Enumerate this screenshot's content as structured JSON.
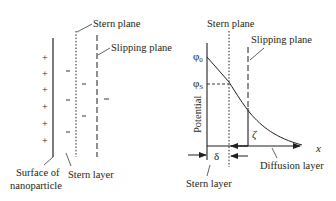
{
  "left_diagram": {
    "labels": {
      "stern_plane": "Stern plane",
      "slipping_plane": "Slipping plane",
      "surface_line1": "Surface of",
      "surface_line2": "nanoparticle",
      "stern_layer": "Stern layer"
    },
    "plus_sign": "+",
    "minus_sign": "−"
  },
  "right_diagram": {
    "labels": {
      "stern_plane": "Stern plane",
      "slipping_plane": "Slipping plane",
      "y_axis": "Potential",
      "x_axis": "x",
      "phi0": "φ",
      "phi0_sub": "0",
      "phis": "φ",
      "phis_sub": "S",
      "zeta": "ζ",
      "delta": "δ",
      "stern_layer": "Stern layer",
      "diffusion_layer": "Diffusion layer"
    }
  },
  "colors": {
    "ink": "#231f20",
    "background": "#ffffff"
  }
}
